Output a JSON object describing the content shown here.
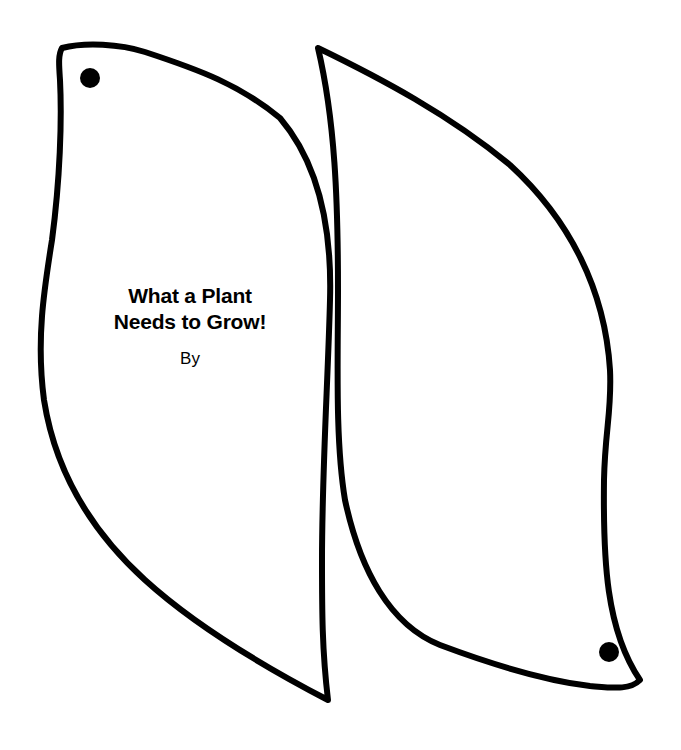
{
  "template": {
    "leaves": [
      {
        "id": "cover",
        "title_lines": [
          "What a Plant",
          "Needs to Grow!"
        ],
        "byline": "By",
        "punch_hole": "top-left"
      },
      {
        "id": "back",
        "punch_hole": "bottom-right"
      }
    ],
    "colors": {
      "outline": "#000000",
      "background": "#ffffff"
    }
  }
}
